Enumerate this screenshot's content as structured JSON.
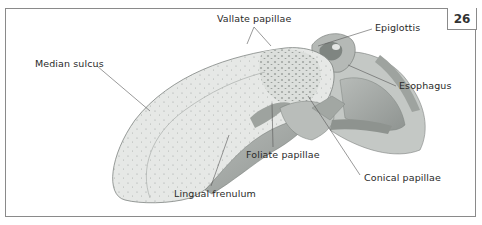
{
  "figure": {
    "number": "26"
  },
  "labels": [
    {
      "id": "median-sulcus",
      "text": "Median sulcus"
    },
    {
      "id": "vallate-papillae",
      "text": "Vallate papillae"
    },
    {
      "id": "epiglottis",
      "text": "Epiglottis"
    },
    {
      "id": "esophagus",
      "text": "Esophagus"
    },
    {
      "id": "foliate-papillae",
      "text": "Foliate papillae"
    },
    {
      "id": "conical-papillae",
      "text": "Conical papillae"
    },
    {
      "id": "lingual-frenulum",
      "text": "Lingual frenulum"
    }
  ],
  "colors": {
    "border": "#8a8a8a",
    "tongue_fill": "#e6e8e6",
    "tongue_dark": "#a8aca9",
    "tissue_mid": "#bfc3c0",
    "leader_line": "#555555",
    "text": "#2a2a2a"
  }
}
